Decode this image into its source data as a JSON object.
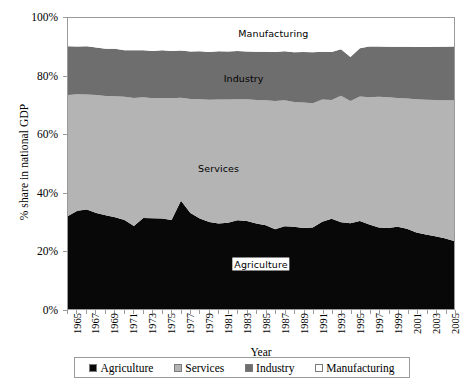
{
  "chart_data": {
    "type": "area",
    "stacked": true,
    "title": "",
    "xlabel": "Year",
    "ylabel": "% share in national GDP",
    "ylim": [
      0,
      100
    ],
    "ytick_labels": [
      "0%",
      "20%",
      "40%",
      "60%",
      "80%",
      "100%"
    ],
    "ytick_values": [
      0,
      20,
      40,
      60,
      80,
      100
    ],
    "grid": false,
    "legend_position": "bottom",
    "x": [
      1965,
      1966,
      1967,
      1968,
      1969,
      1970,
      1971,
      1972,
      1973,
      1974,
      1975,
      1976,
      1977,
      1978,
      1979,
      1980,
      1981,
      1982,
      1983,
      1984,
      1985,
      1986,
      1987,
      1988,
      1989,
      1990,
      1991,
      1992,
      1993,
      1994,
      1995,
      1996,
      1997,
      1998,
      1999,
      2000,
      2001,
      2002,
      2003,
      2004,
      2005,
      2006
    ],
    "xtick_labels": [
      "1965",
      "1967",
      "1969",
      "1971",
      "1973",
      "1975",
      "1977",
      "1979",
      "1981",
      "1983",
      "1985",
      "1987",
      "1989",
      "1991",
      "1993",
      "1995",
      "1997",
      "1999",
      "2001",
      "2003",
      "2005"
    ],
    "series": [
      {
        "name": "Agriculture",
        "color": "#080808",
        "values": [
          32.0,
          33.8,
          34.2,
          33.0,
          32.2,
          31.5,
          30.6,
          28.5,
          31.3,
          31.2,
          31.1,
          30.6,
          37.2,
          33.0,
          31.1,
          29.9,
          29.4,
          29.6,
          30.5,
          30.2,
          29.4,
          28.8,
          27.4,
          28.4,
          28.3,
          27.8,
          28.0,
          30.0,
          31.0,
          29.8,
          29.5,
          30.2,
          29.0,
          28.0,
          27.8,
          28.3,
          27.6,
          26.3,
          25.6,
          25.0,
          24.3,
          23.4
        ]
      },
      {
        "name": "Services",
        "color": "#b4b4b4",
        "values": [
          41.5,
          40.0,
          39.5,
          40.5,
          41.0,
          41.6,
          42.3,
          44.0,
          41.5,
          41.2,
          41.4,
          41.8,
          35.4,
          39.2,
          41.0,
          42.0,
          42.6,
          42.4,
          41.6,
          41.9,
          42.4,
          42.9,
          44.1,
          43.3,
          42.8,
          43.2,
          42.7,
          42.0,
          40.8,
          43.5,
          42.0,
          42.8,
          43.8,
          44.9,
          45.0,
          44.2,
          44.7,
          45.8,
          46.3,
          46.8,
          47.4,
          48.3
        ]
      },
      {
        "name": "Industry",
        "color": "#6e6e6e",
        "values": [
          16.8,
          16.4,
          16.6,
          16.4,
          16.2,
          16.3,
          16.0,
          16.4,
          16.1,
          16.3,
          16.4,
          16.3,
          16.2,
          16.3,
          16.5,
          16.4,
          16.6,
          16.5,
          16.6,
          16.4,
          16.6,
          16.7,
          16.8,
          16.9,
          17.1,
          17.3,
          17.5,
          16.4,
          16.5,
          16.0,
          15.1,
          16.6,
          17.4,
          17.3,
          17.3,
          17.6,
          17.8,
          17.9,
          18.1,
          18.3,
          18.4,
          18.5
        ]
      },
      {
        "name": "Manufacturing",
        "color": "#ffffff",
        "values": [
          9.7,
          9.8,
          9.7,
          10.1,
          10.6,
          10.6,
          11.1,
          11.1,
          11.1,
          11.3,
          11.1,
          11.3,
          11.2,
          11.5,
          11.4,
          11.7,
          11.4,
          11.5,
          11.3,
          11.5,
          11.6,
          11.6,
          11.7,
          11.4,
          11.8,
          11.7,
          11.8,
          11.6,
          11.7,
          10.7,
          13.4,
          10.4,
          9.8,
          9.8,
          9.9,
          9.9,
          9.9,
          10.0,
          10.0,
          9.9,
          9.9,
          9.8
        ]
      }
    ],
    "inline_labels": [
      {
        "text": "Manufacturing",
        "x_pct": 53.2,
        "y_pct": 5.0,
        "boxed": false
      },
      {
        "text": "Industry",
        "x_pct": 45.5,
        "y_pct": 20.5,
        "boxed": false
      },
      {
        "text": "Services",
        "x_pct": 39.0,
        "y_pct": 51.5,
        "boxed": false
      },
      {
        "text": "Agriculture",
        "x_pct": 50.0,
        "y_pct": 84.5,
        "boxed": true
      }
    ],
    "legend": [
      {
        "label": "Agriculture",
        "color": "#080808"
      },
      {
        "label": "Services",
        "color": "#b4b4b4"
      },
      {
        "label": "Industry",
        "color": "#6e6e6e"
      },
      {
        "label": "Manufacturing",
        "color": "#ffffff"
      }
    ]
  }
}
